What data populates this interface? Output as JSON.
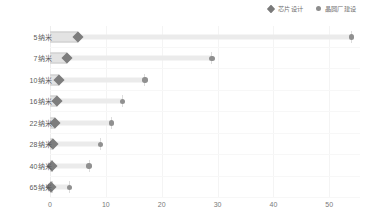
{
  "chart_data": {
    "type": "bar",
    "title": "",
    "subtitle": "",
    "xlabel": "",
    "ylabel": "",
    "orientation": "horizontal",
    "style": "dumbbell",
    "grid": true,
    "legend_position": "top-right",
    "xlim": [
      0,
      55.5
    ],
    "xticks": [
      0,
      10,
      20,
      30,
      40,
      50
    ],
    "xticklabels": [
      "0",
      "10",
      "20",
      "30",
      "40",
      "50"
    ],
    "categories": [
      "5纳米",
      "7纳米",
      "10纳米",
      "16纳米",
      "22纳米",
      "28纳米",
      "40纳米",
      "65纳米"
    ],
    "series": [
      {
        "name": "芯片设计",
        "marker": "diamond",
        "color": "#7d7d7d",
        "values": [
          5.0,
          3.0,
          1.7,
          1.2,
          0.9,
          0.6,
          0.4,
          0.2
        ]
      },
      {
        "name": "晶圆厂建设",
        "marker": "circle",
        "color": "#909090",
        "values": [
          54.0,
          29.0,
          17.0,
          13.0,
          11.0,
          9.0,
          7.0,
          3.5
        ]
      }
    ]
  },
  "legend": {
    "items": [
      {
        "label": "芯片设计",
        "marker": "diamond"
      },
      {
        "label": "晶圆厂建设",
        "marker": "circle"
      }
    ]
  },
  "colors": {
    "diamond": "#7d7d7d",
    "circle": "#909090",
    "connector": "#ebebeb",
    "stub_fill": "#e3e3e3",
    "stub_border": "#c9c9c9",
    "grid": "#f4f4f4",
    "axis_text": "#7a7a7a",
    "label_text": "#595959"
  }
}
